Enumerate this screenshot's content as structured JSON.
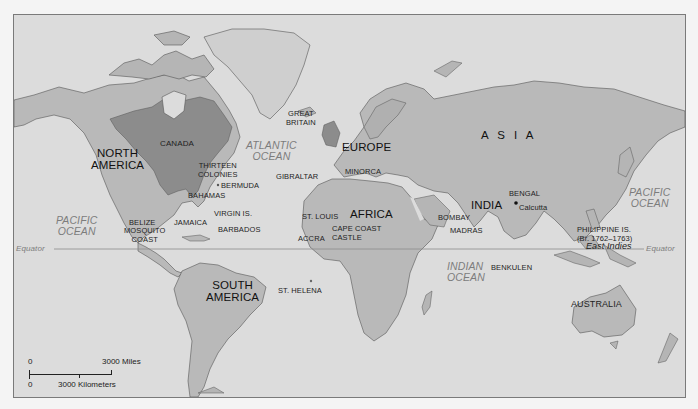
{
  "map": {
    "colors": {
      "ocean": "#dcdcdc",
      "land": "#b9b9b9",
      "land_dark": "#a8a8a8",
      "british_territory": "#8c8c8c",
      "greenland": "#cfcfcf",
      "frame": "#7a7a7a",
      "ocean_label": "#7c7c7c"
    },
    "continents": {
      "north_america": "NORTH\nAMERICA",
      "south_america": "SOUTH\nAMERICA",
      "europe": "EUROPE",
      "africa": "AFRICA",
      "asia": "A S I A",
      "india": "INDIA",
      "australia": "AUSTRALIA"
    },
    "oceans": {
      "atlantic": "ATLANTIC\nOCEAN",
      "pacific_west": "PACIFIC\nOCEAN",
      "pacific_east": "PACIFIC\nOCEAN",
      "indian": "INDIAN\nOCEAN"
    },
    "places": {
      "canada": "CANADA",
      "thirteen_colonies": "THIRTEEN\nCOLONIES",
      "bermuda": "BERMUDA",
      "bahamas": "BAHAMAS",
      "virgin_is": "VIRGIN IS.",
      "jamaica": "JAMAICA",
      "barbados": "BARBADOS",
      "belize": "BELIZE",
      "mosquito_coast": "MOSQUITO\nCOAST",
      "great_britain": "GREAT\nBRITAIN",
      "gibraltar": "GIBRALTAR",
      "minorca": "MINORCA",
      "st_louis": "ST. LOUIS",
      "accra": "ACCRA",
      "cape_coast_castle": "CAPE COAST\nCASTLE",
      "st_helena": "ST. HELENA",
      "bombay": "BOMBAY",
      "madras": "MADRAS",
      "bengal": "BENGAL",
      "calcutta": "Calcutta",
      "philippine_is": "PHILIPPINE IS.\n(Br. 1762–1763)",
      "benkulen": "BENKULEN",
      "east_indies": "East Indies"
    },
    "equator": {
      "left_label": "Equator",
      "right_label": "Equator"
    },
    "scale_bar": {
      "miles_zero": "0",
      "miles_label": "3000 Miles",
      "km_zero": "0",
      "km_label": "3000 Kilometers"
    }
  }
}
